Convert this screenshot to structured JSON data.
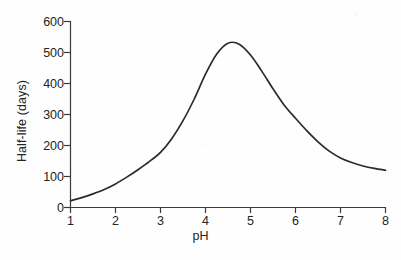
{
  "chart_data": {
    "type": "line",
    "title": "",
    "xlabel": "pH",
    "ylabel": "Half-life (days)",
    "xlim": [
      1,
      8
    ],
    "ylim": [
      0,
      600
    ],
    "xticks": [
      "1",
      "2",
      "3",
      "4",
      "5",
      "6",
      "7",
      "8"
    ],
    "yticks": [
      "0",
      "100",
      "200",
      "300",
      "400",
      "500",
      "600"
    ],
    "grid": false,
    "legend": null,
    "x": [
      1.0,
      1.25,
      1.5,
      1.75,
      2.0,
      2.25,
      2.5,
      2.75,
      3.0,
      3.25,
      3.5,
      3.75,
      4.0,
      4.25,
      4.5,
      4.75,
      5.0,
      5.25,
      5.5,
      5.75,
      6.0,
      6.25,
      6.5,
      6.75,
      7.0,
      7.25,
      7.5,
      7.75,
      8.0
    ],
    "values": [
      22,
      32,
      44,
      58,
      76,
      98,
      122,
      148,
      178,
      222,
      280,
      350,
      430,
      495,
      530,
      527,
      492,
      440,
      383,
      330,
      288,
      248,
      212,
      182,
      160,
      145,
      134,
      126,
      120
    ],
    "series": [
      {
        "name": "Half-life vs pH",
        "color": "#2b2b2b",
        "values": [
          22,
          32,
          44,
          58,
          76,
          98,
          122,
          148,
          178,
          222,
          280,
          350,
          430,
          495,
          530,
          527,
          492,
          440,
          383,
          330,
          288,
          248,
          212,
          182,
          160,
          145,
          134,
          126,
          120
        ]
      }
    ],
    "peak": {
      "x": 4.5,
      "y": 530
    },
    "axis_color": "#3a3a3a",
    "curve_color": "#2b2b2b",
    "background": "#fefefe"
  },
  "axes": {
    "y_label": "Half-life (days)",
    "x_label": "pH",
    "y_tick_labels": [
      "600",
      "500",
      "400",
      "300",
      "200",
      "100",
      "0"
    ],
    "x_tick_labels": [
      "1",
      "2",
      "3",
      "4",
      "5",
      "6",
      "7",
      "8"
    ]
  }
}
